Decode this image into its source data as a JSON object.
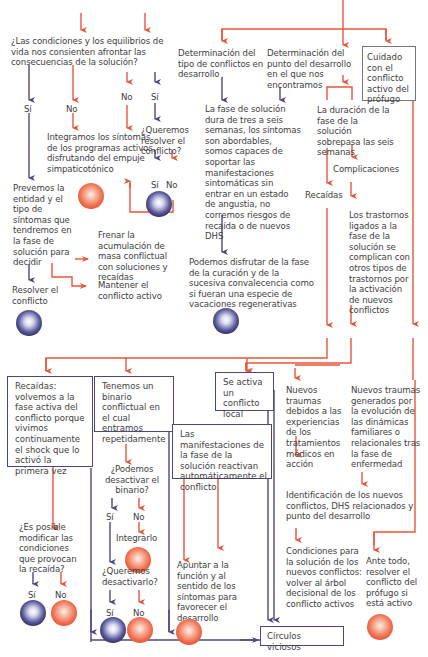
{
  "colors": {
    "red": "#e8553b",
    "blue": "#4a4880",
    "text": "#3e3e3e"
  },
  "nodes": {
    "q_condiciones": "¿Las condiciones y los equilibrios de vida nos consienten afrontar las consecuencias de la solución?",
    "si_left": "Sí",
    "no_left": "No",
    "no_mid": "No",
    "si_mid": "Sí",
    "queremos_resolver": "¿Queremos resolver el conflicto?",
    "si_qr": "Sí",
    "no_qr": "No",
    "integramos": "Integramos los síntomas de los programas activos, disfrutando del empuje simpaticotónico",
    "prevemos": "Prevemos la entidad y el tipo de síntomas que tendremos en la fase de solución para decidir",
    "resolver_conflicto": "Resolver el conflicto",
    "frenar": "Frenar la acumulación de masa conflictual con soluciones y recaídas",
    "mantener": "Mantener el conflicto activo",
    "det_tipo": "Determinación del tipo de conflictos en desarrollo",
    "det_punto": "Determinación del punto del desarrollo en el que nos encontramos",
    "cuidado": "Cuidado con el conflicto activo del prófugo",
    "fase_solucion": "La fase de solución dura de tres a seis semanas, los síntomas son abordables, somos capaces de soportar las manifestaciones sintomáticas sin entrar en un estado de angustia, no corremos riesgos de recaída o de nuevos DHS",
    "podemos_disfrutar": "Podemos disfrutar de la fase de la curación y de la sucesiva convalecencia como si fueran una especie de vacaciones regenerativas",
    "duracion": "La duración de la fase de la solución sobrepasa las seis semanas",
    "complicaciones": "Complicaciones",
    "recaidas_label": "Recaídas",
    "trastornos": "Los trastornos ligados a la fase de la solución se complican con otros tipos de trastornos por la activación de nuevos conflictos",
    "recaidas_box": "Recaídas: volvemos a la fase activa del conflicto porque vivimos continuamente el shock que lo activó la primera vez",
    "binario_box": "Tenemos un binario conflictual en el cual entramos repetidamente",
    "conflicto_local": "Se activa un conflicto local",
    "manifestaciones": "Las manifestaciones de la fase de la solución reactivan automáticamente el conflicto",
    "nuevos_traumas_1": "Nuevos traumas debidos a las experiencias de los tratamientos médicos en acción",
    "nuevos_traumas_2": "Nuevos traumas generados por la evolución de las dinámicas familiares o relacionales tras la fase de enfermedad",
    "q_posible": "¿Es posible modificar las condiciones que provocan la recaída?",
    "si_pos": "Sí",
    "no_pos": "No",
    "q_desactivar_binario": "¿Podemos desactivar el binario?",
    "si_bin": "Sí",
    "no_bin": "No",
    "integrarlo": "Integrarlo",
    "q_queremos_desactivar": "¿Queremos desactivarlo?",
    "si_des": "Sí",
    "no_des": "No",
    "apuntar": "Apuntar a la función y al sentido de los síntomas para favorecer el desarrollo",
    "identificacion": "Identificación de los nuevos conflictos, DHS relacionados y punto del desarrollo",
    "condiciones_nuevos": "Condiciones para la solución de los nuevos conflictos: volver al árbol decisional de los conflicto activos",
    "ante_todo": "Ante todo, resolver el conflicto del prófugo si está activo",
    "circulos": "Círculos viciosos"
  }
}
